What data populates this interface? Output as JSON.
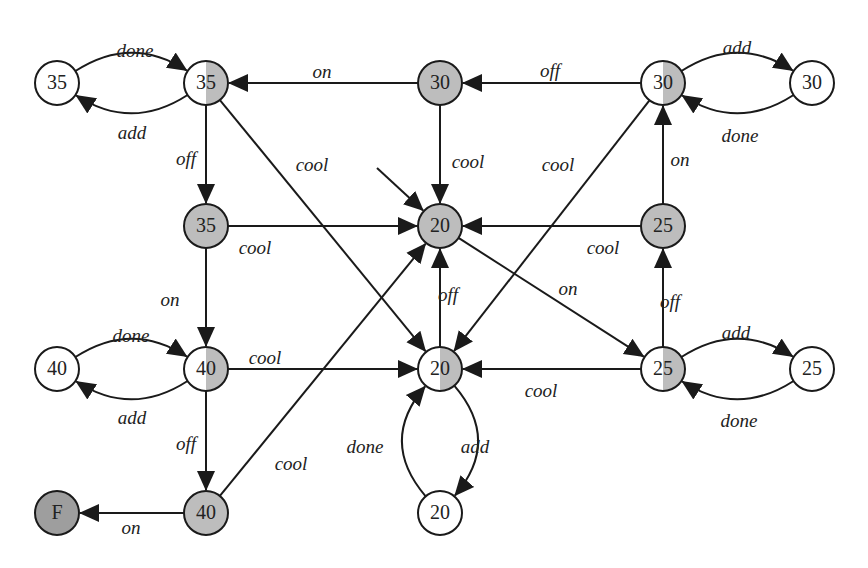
{
  "colors": {
    "white": "#ffffff",
    "shaded": "#bdbdbd",
    "final": "#9e9e9e",
    "stroke": "#1a1a1a"
  },
  "nodes": [
    {
      "id": "n35a",
      "label": "35",
      "x": 57,
      "y": 83,
      "fill": "white"
    },
    {
      "id": "n35b",
      "label": "35",
      "x": 206,
      "y": 83,
      "fill": "half"
    },
    {
      "id": "n30a",
      "label": "30",
      "x": 440,
      "y": 83,
      "fill": "shaded"
    },
    {
      "id": "n30b",
      "label": "30",
      "x": 663,
      "y": 83,
      "fill": "half"
    },
    {
      "id": "n30c",
      "label": "30",
      "x": 812,
      "y": 83,
      "fill": "white"
    },
    {
      "id": "n35c",
      "label": "35",
      "x": 206,
      "y": 226,
      "fill": "shaded"
    },
    {
      "id": "n20a",
      "label": "20",
      "x": 440,
      "y": 226,
      "fill": "shaded"
    },
    {
      "id": "n25a",
      "label": "25",
      "x": 663,
      "y": 226,
      "fill": "shaded"
    },
    {
      "id": "n40a",
      "label": "40",
      "x": 57,
      "y": 369,
      "fill": "white"
    },
    {
      "id": "n40b",
      "label": "40",
      "x": 206,
      "y": 369,
      "fill": "half"
    },
    {
      "id": "n20b",
      "label": "20",
      "x": 440,
      "y": 369,
      "fill": "half"
    },
    {
      "id": "n25b",
      "label": "25",
      "x": 663,
      "y": 369,
      "fill": "half"
    },
    {
      "id": "n25c",
      "label": "25",
      "x": 812,
      "y": 369,
      "fill": "white"
    },
    {
      "id": "nF",
      "label": "F",
      "x": 57,
      "y": 513,
      "fill": "final"
    },
    {
      "id": "n40c",
      "label": "40",
      "x": 206,
      "y": 513,
      "fill": "shaded"
    },
    {
      "id": "n20c",
      "label": "20",
      "x": 440,
      "y": 513,
      "fill": "white"
    }
  ],
  "edges": [
    {
      "from": "n35a",
      "to": "n35b",
      "label": "done",
      "curve": -22,
      "lx": 135,
      "ly": 53
    },
    {
      "from": "n35b",
      "to": "n35a",
      "label": "add",
      "curve": -22,
      "lx": 132,
      "ly": 135
    },
    {
      "from": "n30a",
      "to": "n35b",
      "label": "on",
      "curve": 0,
      "lx": 322,
      "ly": 74
    },
    {
      "from": "n30b",
      "to": "n30a",
      "label": "off",
      "curve": 0,
      "lx": 550,
      "ly": 73
    },
    {
      "from": "n30b",
      "to": "n30c",
      "label": "add",
      "curve": -22,
      "lx": 737,
      "ly": 50
    },
    {
      "from": "n30c",
      "to": "n30b",
      "label": "done",
      "curve": -22,
      "lx": 740,
      "ly": 138
    },
    {
      "from": "n35b",
      "to": "n35c",
      "label": "off",
      "curve": 0,
      "lx": 186,
      "ly": 161
    },
    {
      "from": "n35b",
      "to": "n20b",
      "label": "cool",
      "curve": 0,
      "lx": 312,
      "ly": 167
    },
    {
      "from": "n30a",
      "to": "n20a",
      "label": "cool",
      "curve": 0,
      "lx": 468,
      "ly": 164
    },
    {
      "from": "n30b",
      "to": "n20b",
      "label": "cool",
      "curve": 0,
      "lx": 558,
      "ly": 167
    },
    {
      "from": "n25a",
      "to": "n30b",
      "label": "on",
      "curve": 0,
      "lx": 680,
      "ly": 162
    },
    {
      "from": "n35c",
      "to": "n20a",
      "label": "cool",
      "curve": 0,
      "lx": 255,
      "ly": 250
    },
    {
      "from": "n25a",
      "to": "n20a",
      "label": "cool",
      "curve": 0,
      "lx": 603,
      "ly": 250
    },
    {
      "from": "n35c",
      "to": "n40b",
      "label": "on",
      "curve": 0,
      "lx": 170,
      "ly": 302
    },
    {
      "from": "n20b",
      "to": "n20a",
      "label": "off",
      "curve": 0,
      "lx": 448,
      "ly": 297
    },
    {
      "from": "n20a",
      "to": "n25b",
      "label": "on",
      "curve": 0,
      "lx": 568,
      "ly": 291
    },
    {
      "from": "n25b",
      "to": "n25a",
      "label": "off",
      "curve": 0,
      "lx": 670,
      "ly": 304
    },
    {
      "from": "n40a",
      "to": "n40b",
      "label": "done",
      "curve": -22,
      "lx": 131,
      "ly": 338
    },
    {
      "from": "n40b",
      "to": "n40a",
      "label": "add",
      "curve": -22,
      "lx": 132,
      "ly": 420
    },
    {
      "from": "n40b",
      "to": "n20b",
      "label": "cool",
      "curve": 0,
      "lx": 265,
      "ly": 360
    },
    {
      "from": "n25b",
      "to": "n20b",
      "label": "cool",
      "curve": 0,
      "lx": 541,
      "ly": 393
    },
    {
      "from": "n25b",
      "to": "n25c",
      "label": "add",
      "curve": -22,
      "lx": 736,
      "ly": 335
    },
    {
      "from": "n25c",
      "to": "n25b",
      "label": "done",
      "curve": -22,
      "lx": 739,
      "ly": 423
    },
    {
      "from": "n40b",
      "to": "n40c",
      "label": "off",
      "curve": 0,
      "lx": 186,
      "ly": 446
    },
    {
      "from": "n40c",
      "to": "n20a",
      "label": "cool",
      "curve": 0,
      "lx": 291,
      "ly": 466
    },
    {
      "from": "n40c",
      "to": "nF",
      "label": "on",
      "curve": 0,
      "lx": 131,
      "ly": 530
    },
    {
      "from": "n20c",
      "to": "n20b",
      "label": "done",
      "curve": -28,
      "lx": 365,
      "ly": 449
    },
    {
      "from": "n20b",
      "to": "n20c",
      "label": "add",
      "curve": -28,
      "lx": 475,
      "ly": 449
    }
  ],
  "initial_arrow": {
    "to": "n20a",
    "x1": 377,
    "y1": 168
  }
}
